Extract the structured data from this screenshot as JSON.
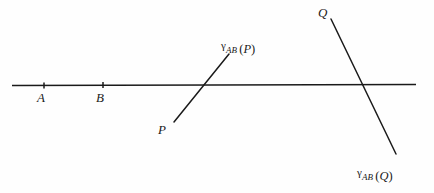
{
  "figure": {
    "background_color": "#fefefe",
    "stroke_color": "#1a1a1a",
    "labels": {
      "point_a": "A",
      "point_b": "B",
      "point_p": "P",
      "point_q": "Q",
      "gamma": "γ",
      "subscript": "AB",
      "image_of_p_open": "(",
      "image_of_p_arg": "P",
      "image_of_p_close": ")",
      "image_of_q_open": "(",
      "image_of_q_arg": "Q",
      "image_of_q_close": ")"
    },
    "geometry": {
      "axis_line": {
        "x1": 12,
        "y1": 85,
        "x2": 416,
        "y2": 84
      },
      "tick_a": {
        "x": 44,
        "y": 85
      },
      "tick_b": {
        "x": 103,
        "y": 85
      },
      "line_p": {
        "x1": 174,
        "y1": 122,
        "x2": 229,
        "y2": 54
      },
      "line_q": {
        "x1": 331,
        "y1": 19,
        "x2": 396,
        "y2": 154
      },
      "intersection_p": {
        "x": 202,
        "y": 85
      },
      "intersection_q": {
        "x": 364,
        "y": 85
      }
    }
  }
}
